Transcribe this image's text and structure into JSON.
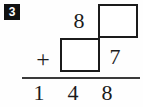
{
  "problem": {
    "number_label": "3",
    "operator": "+",
    "addend_top": {
      "known_digit": "8",
      "blank_digit": ""
    },
    "addend_bottom": {
      "blank_digit": "",
      "known_digit": "7"
    },
    "sum_digits": [
      "1",
      "4",
      "8"
    ],
    "sum_text": "148"
  },
  "colors": {
    "ink": "#1b1b1b",
    "rule": "#3a3a3a",
    "badge_background": "#111111",
    "badge_text": "#ffffff",
    "page_background": "#fefefe",
    "box_fill": "#ffffff"
  }
}
